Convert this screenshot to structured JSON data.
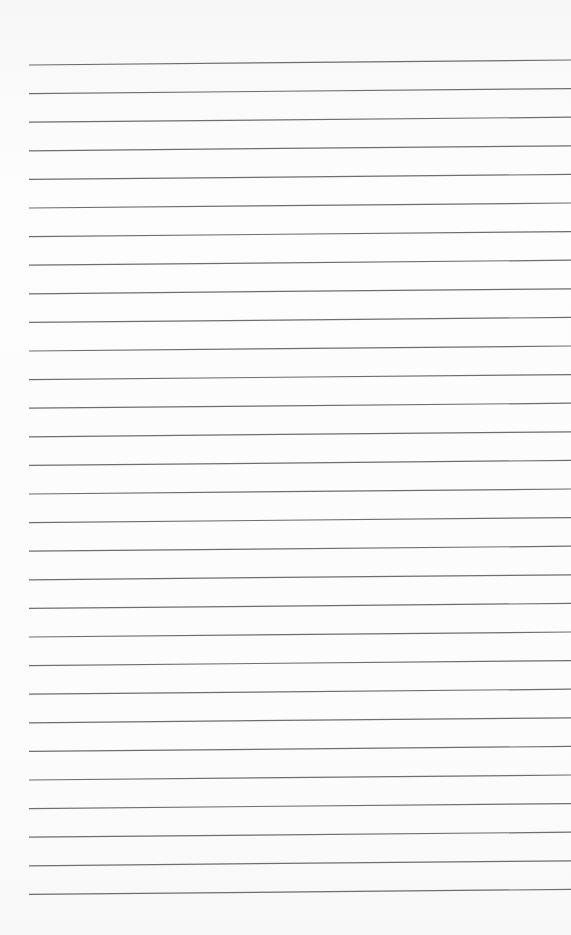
{
  "page": {
    "type": "lined-paper",
    "line_count": 30,
    "first_line_y_left": 65,
    "first_line_y_right": 60,
    "line_spacing": 28.6,
    "line_start_x": 29,
    "line_end_x": 571,
    "line_color": "#6e6e6e",
    "background_color": "#fbfbfb"
  }
}
